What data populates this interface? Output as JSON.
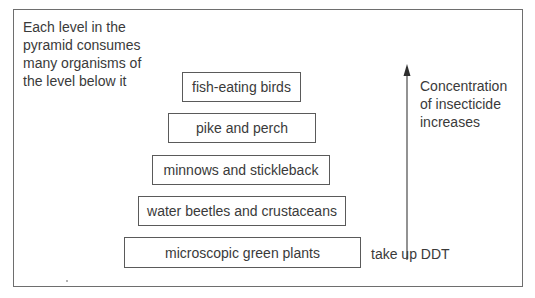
{
  "diagram": {
    "title": "",
    "note_lines": [
      "Each level in the",
      "pyramid consumes",
      "many organisms of",
      "the level below it"
    ],
    "levels": [
      {
        "label": "fish-eating birds",
        "rank": 5
      },
      {
        "label": "pike and perch",
        "rank": 4
      },
      {
        "label": "minnows and stickleback",
        "rank": 3
      },
      {
        "label": "water beetles and crustaceans",
        "rank": 2
      },
      {
        "label": "microscopic green plants",
        "rank": 1
      }
    ],
    "arrow": {
      "direction": "up",
      "label_lines": [
        "Concentration",
        "of insecticide",
        "increases"
      ]
    },
    "base_annotation": "take up DDT"
  },
  "colors": {
    "border": "#6e6e6e",
    "box_border": "#5a5a5a",
    "text": "#3a3a3a",
    "background": "#ffffff"
  }
}
